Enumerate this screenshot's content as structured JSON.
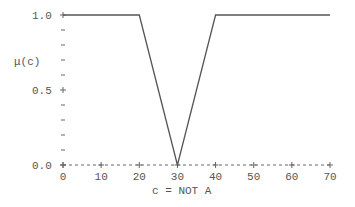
{
  "chart_data": {
    "type": "line",
    "title": "",
    "xlabel": "c = NOT A",
    "ylabel": "μ(c)",
    "xlim": [
      0,
      70
    ],
    "ylim": [
      0.0,
      1.0
    ],
    "x_ticks": [
      "0",
      "10",
      "20",
      "30",
      "40",
      "50",
      "60",
      "70"
    ],
    "y_ticks": [
      "0.0",
      "0.5",
      "1.0"
    ],
    "grid": false,
    "series": [
      {
        "name": "NOT A",
        "x": [
          0,
          20,
          30,
          40,
          70
        ],
        "values": [
          1.0,
          1.0,
          0.0,
          1.0,
          1.0
        ]
      }
    ]
  },
  "labels": {
    "y_axis": "μ(c)",
    "x_axis": "c = NOT A",
    "y_tick_0": "0.0",
    "y_tick_05": "0.5",
    "y_tick_1": "1.0",
    "x_ticks": [
      "0",
      "10",
      "20",
      "30",
      "40",
      "50",
      "60",
      "70"
    ]
  }
}
